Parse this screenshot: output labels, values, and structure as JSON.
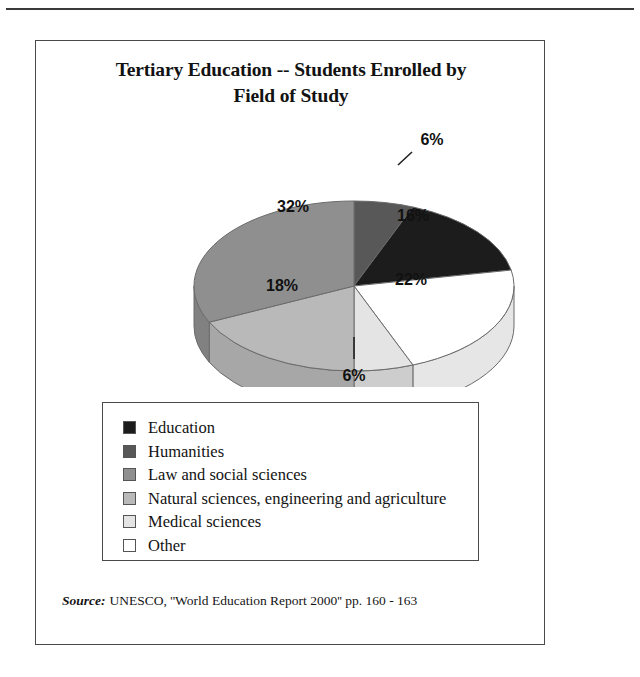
{
  "figure": {
    "title_line1": "Tertiary Education -- Students Enrolled by",
    "title_line2": "Field of Study",
    "source_label": "Source:",
    "source_text": "UNESCO, ''World Education Report 2000'' pp. 160 - 163"
  },
  "legend": {
    "items": [
      {
        "label": "Education",
        "color": "#1c1c1c"
      },
      {
        "label": "Humanities",
        "color": "#585858"
      },
      {
        "label": "Law and social sciences",
        "color": "#8f8f8f"
      },
      {
        "label": "Natural sciences, engineering and agriculture",
        "color": "#b9b9b9"
      },
      {
        "label": "Medical sciences",
        "color": "#e4e4e4"
      },
      {
        "label": "Other",
        "color": "#ffffff"
      }
    ]
  },
  "chart_data": {
    "type": "pie",
    "title": "Tertiary Education -- Students Enrolled by Field of Study",
    "xlabel": "",
    "ylabel": "",
    "unit": "%",
    "legend_position": "bottom",
    "three_d": true,
    "categories": [
      "Education",
      "Humanities",
      "Law and social sciences",
      "Natural sciences, engineering and agriculture",
      "Medical sciences",
      "Other"
    ],
    "values": [
      16,
      6,
      32,
      18,
      6,
      22
    ],
    "labels": [
      "16%",
      "6%",
      "32%",
      "18%",
      "6%",
      "22%"
    ],
    "colors": [
      "#1c1c1c",
      "#585858",
      "#8f8f8f",
      "#b9b9b9",
      "#e4e4e4",
      "#ffffff"
    ],
    "total": 100,
    "slices": [
      {
        "name": "Humanities",
        "value": 6,
        "label": "6%",
        "color": "#585858",
        "start_deg": 0,
        "end_deg": 21.6,
        "label_x": 396,
        "label_y": 26,
        "label_outside": true,
        "leader": [
          [
            362,
            46
          ],
          [
            376,
            33
          ]
        ]
      },
      {
        "name": "Education",
        "value": 16,
        "label": "16%",
        "color": "#1c1c1c",
        "start_deg": 21.6,
        "end_deg": 79.2,
        "label_x": 377,
        "label_y": 102,
        "label_outside": false,
        "leader": null
      },
      {
        "name": "Other",
        "value": 22,
        "label": "22%",
        "color": "#ffffff",
        "start_deg": 79.2,
        "end_deg": 158.4,
        "label_x": 375,
        "label_y": 166,
        "label_outside": false,
        "leader": null
      },
      {
        "name": "Medical sciences",
        "value": 6,
        "label": "6%",
        "color": "#e4e4e4",
        "start_deg": 158.4,
        "end_deg": 180.0,
        "label_x": 318,
        "label_y": 262,
        "label_outside": true,
        "leader": [
          [
            318,
            218
          ],
          [
            318,
            240
          ]
        ]
      },
      {
        "name": "Natural sciences, engineering and agriculture",
        "value": 18,
        "label": "18%",
        "color": "#b9b9b9",
        "start_deg": 180.0,
        "end_deg": 244.8,
        "label_x": 246,
        "label_y": 172,
        "label_outside": false,
        "leader": null
      },
      {
        "name": "Law and social sciences",
        "value": 32,
        "label": "32%",
        "color": "#8f8f8f",
        "start_deg": 244.8,
        "end_deg": 360.0,
        "label_x": 257,
        "label_y": 93,
        "label_outside": false,
        "leader": null
      }
    ],
    "geometry": {
      "cx": 318,
      "cy": 167,
      "rx": 160,
      "ry": 85,
      "depth": 40
    }
  }
}
